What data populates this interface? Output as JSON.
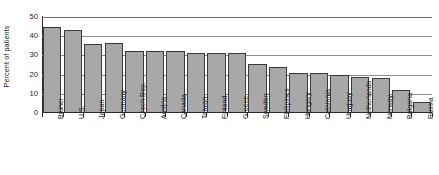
{
  "chart_data": {
    "type": "bar",
    "title": "",
    "subtitle": "",
    "xlabel": "",
    "ylabel": "Percent of patients",
    "ylim": [
      0,
      50
    ],
    "yticks": [
      0,
      10,
      20,
      30,
      40,
      50
    ],
    "grid": "horizontal",
    "legend": "none",
    "bar_color": "#a8a8a8",
    "bar_edge_color": "#3a3a3a",
    "axis_color": "#2b2b2b",
    "gridline_color": "#8c8c8c",
    "categories": [
      "Brunei",
      "U.S.",
      "Japan",
      "Germany",
      "Czech Rep.",
      "Austria",
      "Canada",
      "Taiwan",
      "Finland",
      "Greece",
      "Sweden",
      "Philipines",
      "Hungary",
      "Catalonia",
      "Uruguay",
      "Netherlands",
      "Norway",
      "Bulgaria",
      "Russia"
    ],
    "values": [
      45,
      43,
      36,
      36.5,
      32.5,
      32.5,
      32.5,
      31.5,
      31,
      31,
      25.5,
      24,
      21,
      21,
      20,
      19,
      18,
      12,
      5.5
    ]
  }
}
